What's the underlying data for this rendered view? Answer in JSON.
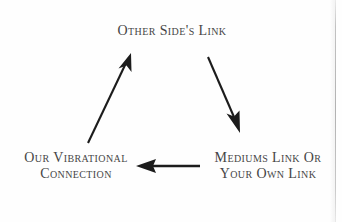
{
  "diagram": {
    "type": "cycle-diagram",
    "background_color": "#fefefe",
    "ink_color": "#2b2b2b",
    "nodes": [
      {
        "id": "other-sides-link",
        "label": "Other Side's Link",
        "position": "top-center"
      },
      {
        "id": "our-vibrational-connection",
        "label": "Our Vibrational\nConnection",
        "position": "bottom-left"
      },
      {
        "id": "mediums-link-or-your-own-link",
        "label": "Mediums Link Or\nYour Own Link",
        "position": "bottom-right"
      }
    ],
    "arrows": [
      {
        "id": "arrow-left-up",
        "from": "our-vibrational-connection",
        "to": "other-sides-link",
        "direction": "up-right"
      },
      {
        "id": "arrow-right-down",
        "from": "other-sides-link",
        "to": "mediums-link-or-your-own-link",
        "direction": "down-right"
      },
      {
        "id": "arrow-bottom-left",
        "from": "mediums-link-or-your-own-link",
        "to": "our-vibrational-connection",
        "direction": "left"
      }
    ]
  }
}
